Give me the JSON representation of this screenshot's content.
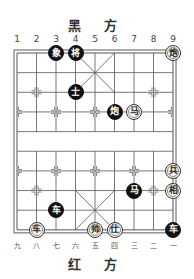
{
  "header": {
    "black_side_label": "黑 方"
  },
  "footer": {
    "red_side_label": "红 方"
  },
  "board": {
    "files": 9,
    "ranks": 10,
    "origin_x": 17,
    "origin_y": 53,
    "step_x": 19.5,
    "step_y": 19.65,
    "line_color": "#555555",
    "top_file_labels": [
      "1",
      "2",
      "3",
      "4",
      "5",
      "6",
      "7",
      "8",
      "9"
    ],
    "bottom_file_labels": [
      "九",
      "八",
      "七",
      "六",
      "五",
      "四",
      "三",
      "二",
      "一"
    ]
  },
  "pieces": [
    {
      "side": "black",
      "char": "象",
      "col": 3,
      "row": 0,
      "name": "black-elephant"
    },
    {
      "side": "black",
      "char": "将",
      "col": 4,
      "row": 0,
      "name": "black-general"
    },
    {
      "side": "red",
      "char": "炮",
      "col": 9,
      "row": 0,
      "name": "red-cannon"
    },
    {
      "side": "black",
      "char": "士",
      "col": 4,
      "row": 2,
      "name": "black-advisor"
    },
    {
      "side": "black",
      "char": "炮",
      "col": 6,
      "row": 3,
      "name": "black-cannon"
    },
    {
      "side": "red",
      "char": "马",
      "col": 7,
      "row": 3,
      "name": "red-horse"
    },
    {
      "side": "red",
      "char": "兵",
      "col": 9,
      "row": 6,
      "name": "red-soldier"
    },
    {
      "side": "black",
      "char": "马",
      "col": 7,
      "row": 7,
      "name": "black-horse"
    },
    {
      "side": "red",
      "char": "相",
      "col": 9,
      "row": 7,
      "name": "red-elephant"
    },
    {
      "side": "black",
      "char": "车",
      "col": 3,
      "row": 8,
      "name": "black-chariot"
    },
    {
      "side": "red",
      "char": "车",
      "col": 2,
      "row": 9,
      "name": "red-chariot"
    },
    {
      "side": "red",
      "char": "帅",
      "col": 5,
      "row": 9,
      "name": "red-general"
    },
    {
      "side": "red",
      "char": "仕",
      "col": 6,
      "row": 9,
      "name": "red-advisor"
    },
    {
      "side": "black",
      "char": "车",
      "col": 9,
      "row": 9,
      "name": "black-chariot"
    }
  ]
}
